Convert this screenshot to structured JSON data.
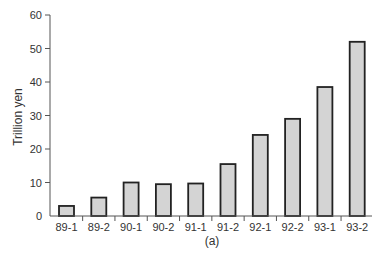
{
  "chart_data": {
    "type": "bar",
    "title": "",
    "caption": "(a)",
    "xlabel": "",
    "ylabel": "Trillion yen",
    "ylim": [
      0,
      60
    ],
    "yticks": [
      0,
      10,
      20,
      30,
      40,
      50,
      60
    ],
    "grid": false,
    "legend": null,
    "categories": [
      "89-1",
      "89-2",
      "90-1",
      "90-2",
      "91-1",
      "91-2",
      "92-1",
      "92-2",
      "93-1",
      "93-2"
    ],
    "values": [
      3,
      5.5,
      10,
      9.5,
      9.7,
      15.5,
      24.2,
      29,
      38.5,
      52
    ],
    "colors": {
      "bar_fill": "#d4d4d4",
      "bar_stroke": "#222222",
      "axis": "#555555",
      "text": "#333333"
    }
  }
}
